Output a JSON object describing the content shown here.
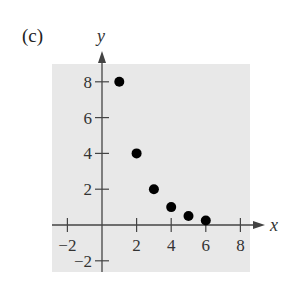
{
  "panel_label": "(c)",
  "chart_data": {
    "type": "scatter",
    "title": "",
    "xlabel": "x",
    "ylabel": "y",
    "x": [
      1,
      2,
      3,
      4,
      5,
      6
    ],
    "y": [
      8,
      4,
      2,
      1,
      0.5,
      0.25
    ],
    "xlim": [
      -3,
      9
    ],
    "ylim": [
      -2.5,
      9
    ],
    "x_ticks": [
      -2,
      2,
      4,
      6,
      8
    ],
    "y_ticks": [
      -2,
      2,
      4,
      6,
      8
    ],
    "grid": false,
    "background": "#e8e8e8",
    "point_color": "#000000"
  }
}
